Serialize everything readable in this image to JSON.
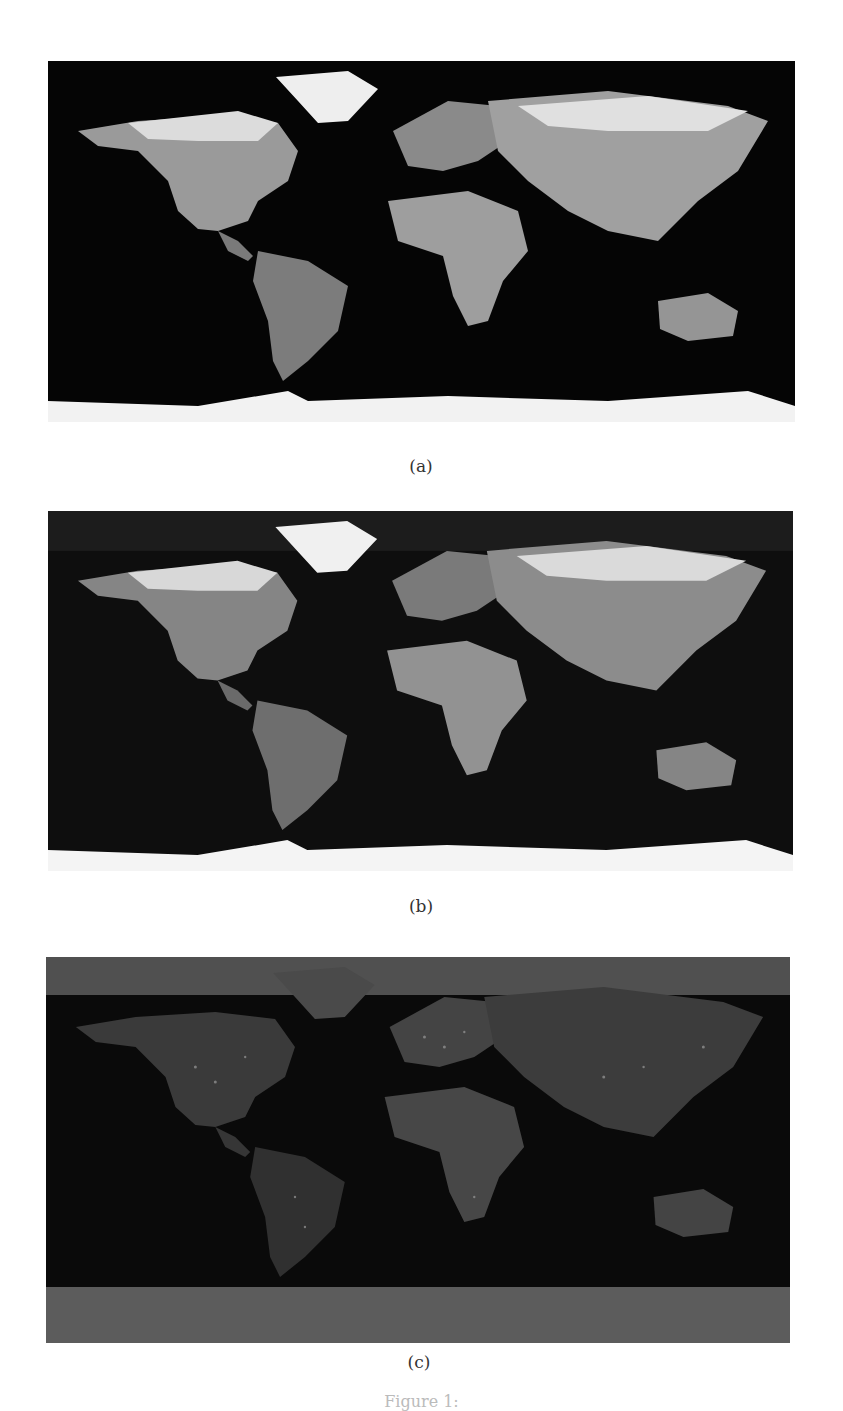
{
  "figure": {
    "subfigures": [
      {
        "label": "(a)",
        "description": "world-map-daytime-grayscale",
        "ocean_color": "#050505",
        "land_color": "#8a8a8a",
        "ice_color": "#f2f2f2",
        "background_band_color": "#050505"
      },
      {
        "label": "(b)",
        "description": "world-map-enhanced-grayscale",
        "ocean_color": "#0e0e0e",
        "land_color": "#7a7a7a",
        "ice_color": "#f4f4f4",
        "background_band_color": "#1c1c1c"
      },
      {
        "label": "(c)",
        "description": "world-map-night-lights-grayscale",
        "ocean_color": "#0a0a0a",
        "land_color": "#3e3e3e",
        "ice_color": "#4a4a4a",
        "background_band_color": "#555555"
      }
    ],
    "caption": "Figure 1:"
  }
}
